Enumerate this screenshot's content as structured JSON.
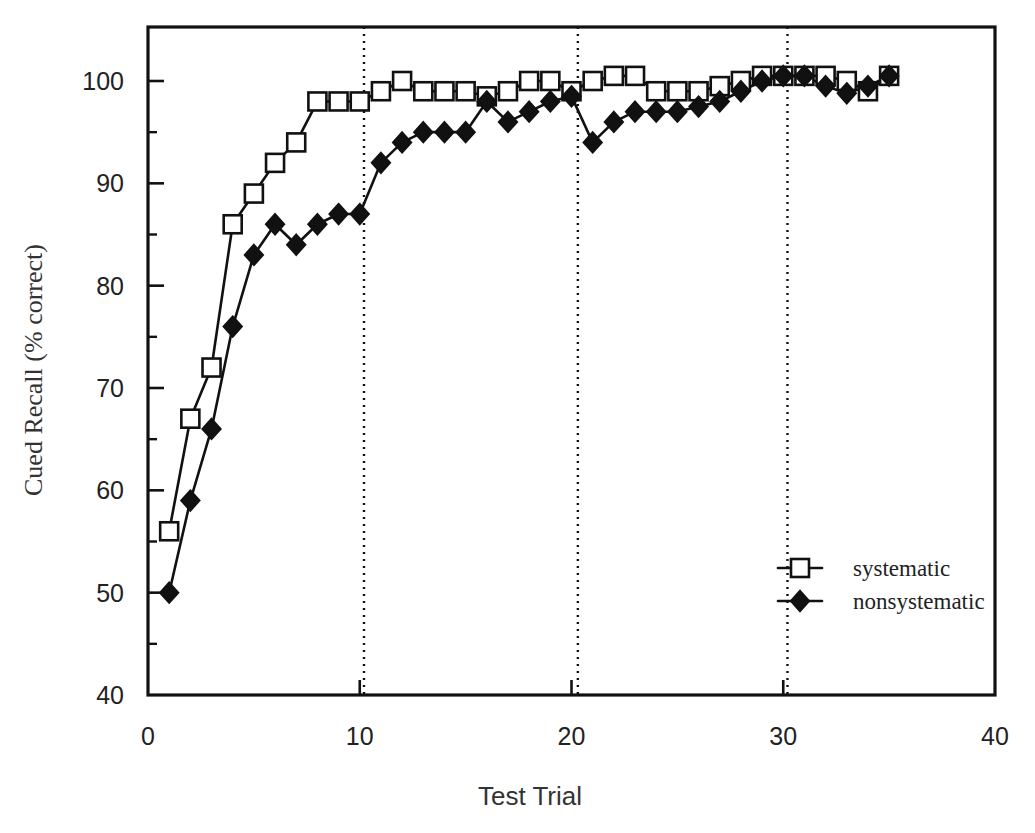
{
  "chart_data": {
    "type": "line",
    "title": "",
    "xlabel": "Test Trial",
    "ylabel": "Cued Recall (% correct)",
    "xlim": [
      0,
      40
    ],
    "ylim": [
      40,
      102
    ],
    "xticks": [
      0,
      10,
      20,
      30,
      40
    ],
    "xtick_labels": [
      "0",
      "10",
      "20",
      "30",
      "40"
    ],
    "yticks": [
      40,
      50,
      60,
      70,
      80,
      90,
      100
    ],
    "ytick_labels": [
      "40",
      "50",
      "60",
      "70",
      "80",
      "90",
      "100"
    ],
    "yticks_minor": [
      45,
      55,
      65,
      75,
      85,
      95
    ],
    "grid": false,
    "legend_position": "lower-right-inside",
    "annotations": {
      "phase_lines_x": [
        10.2,
        20.3,
        30.2
      ],
      "phase_line_style": "dotted-vertical"
    },
    "x": [
      1,
      2,
      3,
      4,
      5,
      6,
      7,
      8,
      9,
      10,
      11,
      12,
      13,
      14,
      15,
      16,
      17,
      18,
      19,
      20,
      21,
      22,
      23,
      24,
      25,
      26,
      27,
      28,
      29,
      30,
      31,
      32,
      33,
      34,
      35
    ],
    "series": [
      {
        "name": "systematic",
        "marker": "open-square",
        "values": [
          56,
          67,
          72,
          86,
          89,
          92,
          94,
          98,
          98,
          98,
          99,
          100,
          99,
          99,
          99,
          98.5,
          99,
          100,
          100,
          99,
          100,
          100.5,
          100.5,
          99,
          99,
          99,
          99.5,
          100,
          100.5,
          100.5,
          100.5,
          100.5,
          100,
          99,
          100.5
        ]
      },
      {
        "name": "nonsystematic",
        "marker": "filled-diamond",
        "values": [
          50,
          59,
          66,
          76,
          83,
          86,
          84,
          86,
          87,
          87,
          92,
          94,
          95,
          95,
          95,
          98,
          96,
          97,
          98,
          98.5,
          94,
          96,
          97,
          97,
          97,
          97.5,
          98,
          99,
          100,
          100.5,
          100.5,
          99.5,
          98.8,
          99.5,
          100.5
        ]
      }
    ],
    "legend": [
      {
        "label": "systematic",
        "marker": "open-square"
      },
      {
        "label": "nonsystematic",
        "marker": "filled-diamond"
      }
    ]
  }
}
